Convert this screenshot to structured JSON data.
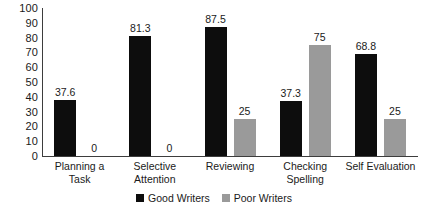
{
  "chart_data": {
    "type": "bar",
    "title": "",
    "subtitle": "",
    "xlabel": "",
    "ylabel": "",
    "ylim": [
      0,
      100
    ],
    "ytick_labels": [
      "100",
      "90",
      "80",
      "70",
      "60",
      "50",
      "40",
      "30",
      "20",
      "10",
      "0"
    ],
    "ytick_values": [
      100,
      90,
      80,
      70,
      60,
      50,
      40,
      30,
      20,
      10,
      0
    ],
    "grid": false,
    "legend_position": "bottom-center",
    "categories": [
      "Planning a Task",
      "Selective\nAttention",
      "Reviewing",
      "Checking\nSpelling",
      "Self Evaluation"
    ],
    "series": [
      {
        "name": "Good Writers",
        "color": "#0d0d0d",
        "values": [
          37.6,
          81.3,
          87.5,
          37.3,
          68.8
        ],
        "value_labels": [
          "37.6",
          "81.3",
          "87.5",
          "37.3",
          "68.8"
        ]
      },
      {
        "name": "Poor Writers",
        "color": "#9a9a9a",
        "values": [
          0,
          0,
          25,
          75,
          25
        ],
        "value_labels": [
          "0",
          "0",
          "25",
          "75",
          "25"
        ]
      }
    ]
  },
  "legend": {
    "items": [
      {
        "label": "Good Writers",
        "swatch": "good-writers-swatch"
      },
      {
        "label": "Poor Writers",
        "swatch": "poor-writers-swatch"
      }
    ]
  },
  "colors": {
    "good_writers": "#0d0d0d",
    "poor_writers": "#9a9a9a",
    "axis": "#3d3d3d",
    "text": "#1a1a1a",
    "background": "#ffffff"
  }
}
